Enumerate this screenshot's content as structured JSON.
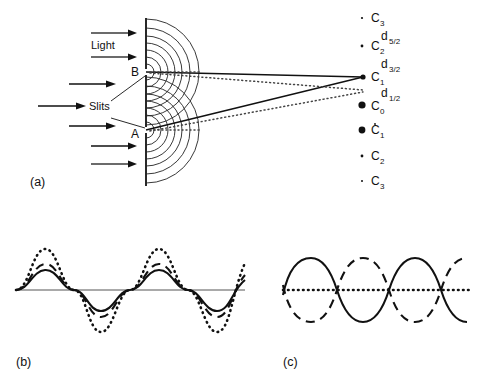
{
  "figure": {
    "panels": [
      {
        "id": "a",
        "label": "(a)"
      },
      {
        "id": "b",
        "label": "(b)"
      },
      {
        "id": "c",
        "label": "(c)"
      }
    ]
  },
  "panel_a": {
    "labels": {
      "light": "Light",
      "slits": "Slits",
      "slit_upper": "B",
      "slit_lower": "A"
    },
    "screen_points": [
      {
        "name": "C",
        "sub": "3",
        "dot": "tiny",
        "accent": false
      },
      {
        "name": "C",
        "sub": "2",
        "dot": "small",
        "accent": false
      },
      {
        "name": "C",
        "sub": "1",
        "dot": "medium",
        "accent": false
      },
      {
        "name": "C",
        "sub": "0",
        "dot": "large",
        "accent": false
      },
      {
        "name": "C",
        "sub": "1",
        "dot": "large",
        "accent": true
      },
      {
        "name": "C",
        "sub": "2",
        "dot": "small",
        "accent": false
      },
      {
        "name": "C",
        "sub": "3",
        "dot": "tiny",
        "accent": false
      }
    ],
    "path_differences": [
      {
        "name": "d",
        "sub": "5/2"
      },
      {
        "name": "d",
        "sub": "3/2"
      },
      {
        "name": "d",
        "sub": "1/2"
      }
    ],
    "arc_count_per_slit": 7,
    "incoming_arrow_count": 7,
    "colors": {
      "ink": "#111111",
      "arc": "#222222",
      "arrow": "#3a3a3a",
      "axis": "#555555"
    }
  },
  "panel_b": {
    "caption": "(b)",
    "description": "constructive interference",
    "waves": [
      {
        "style": "solid",
        "amplitude": 30,
        "phase": 0
      },
      {
        "style": "dashed",
        "amplitude": 38,
        "phase": 0
      },
      {
        "style": "dotted",
        "amplitude": 62,
        "phase": 0
      }
    ],
    "cycles": 2.6,
    "baseline": true
  },
  "panel_c": {
    "caption": "(c)",
    "description": "destructive interference",
    "waves": [
      {
        "style": "solid",
        "amplitude": 40,
        "phase": 0
      },
      {
        "style": "dashed",
        "amplitude": 40,
        "phase": 180
      },
      {
        "style": "dotted",
        "amplitude": 0,
        "phase": 0
      }
    ],
    "cycles": 2.5,
    "baseline": true
  }
}
